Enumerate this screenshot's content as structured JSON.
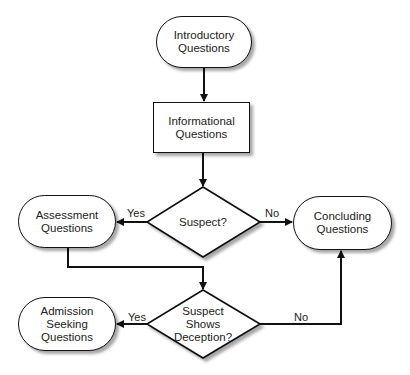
{
  "diagram": {
    "type": "flowchart",
    "nodes": {
      "introductory": {
        "label": "Introductory\nQuestions",
        "shape": "terminator"
      },
      "informational": {
        "label": "Informational\nQuestions",
        "shape": "process"
      },
      "suspect": {
        "label": "Suspect?",
        "shape": "decision"
      },
      "assessment": {
        "label": "Assessment\nQuestions",
        "shape": "terminator"
      },
      "concluding": {
        "label": "Concluding\nQuestions",
        "shape": "terminator"
      },
      "deception": {
        "label": "Suspect\nShows\nDeception?",
        "shape": "decision"
      },
      "admission": {
        "label": "Admission\nSeeking\nQuestions",
        "shape": "terminator"
      }
    },
    "edge_labels": {
      "suspect_yes": "Yes",
      "suspect_no": "No",
      "deception_yes": "Yes",
      "deception_no": "No"
    },
    "edges": [
      {
        "from": "introductory",
        "to": "informational",
        "label": ""
      },
      {
        "from": "informational",
        "to": "suspect",
        "label": ""
      },
      {
        "from": "suspect",
        "to": "assessment",
        "label": "Yes"
      },
      {
        "from": "suspect",
        "to": "concluding",
        "label": "No"
      },
      {
        "from": "assessment",
        "to": "deception",
        "label": ""
      },
      {
        "from": "deception",
        "to": "admission",
        "label": "Yes"
      },
      {
        "from": "deception",
        "to": "concluding",
        "label": "No"
      }
    ],
    "colors": {
      "stroke": "#111111",
      "fill": "#ffffff",
      "text": "#222222"
    }
  }
}
